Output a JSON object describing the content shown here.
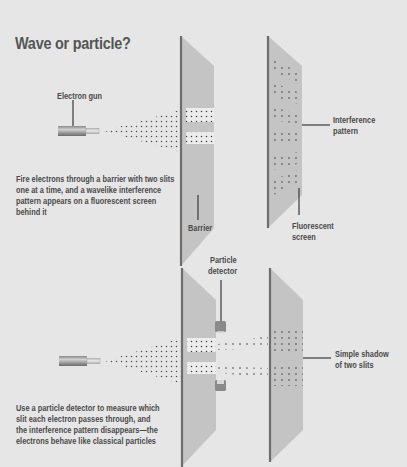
{
  "title": "Wave or particle?",
  "top_panel": {
    "labels": {
      "electron_gun": "Electron gun",
      "barrier": "Barrier",
      "interference_pattern_line1": "Interference",
      "interference_pattern_line2": "pattern",
      "fluorescent_screen_line1": "Fluorescent",
      "fluorescent_screen_line2": "screen"
    },
    "description": [
      "Fire electrons through a barrier with two slits",
      "one at a time, and a wavelike interference",
      "pattern appears on a fluorescent screen",
      "behind it"
    ]
  },
  "bottom_panel": {
    "labels": {
      "particle_detector_line1": "Particle",
      "particle_detector_line2": "detector",
      "simple_shadow_line1": "Simple shadow",
      "simple_shadow_line2": "of two slits"
    },
    "description": [
      "Use a particle detector to measure which",
      "slit each electron passes through, and",
      "the interference pattern disappears—the",
      "electrons behave like classical particles"
    ]
  },
  "colors": {
    "background": "#e6e6e6",
    "panel_fill": "#c4c4c4",
    "panel_edge": "#6e6e6e",
    "text": "#4a4a4a",
    "dots": "#3a3a3a"
  }
}
